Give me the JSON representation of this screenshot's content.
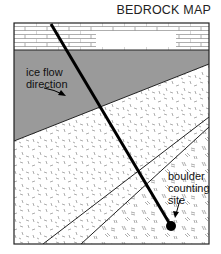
{
  "title": "BEDROCK MAP",
  "labels": {
    "ice_flow_line1": "ice flow",
    "ice_flow_line2": "direction",
    "site_line1": "boulder",
    "site_line2": "counting",
    "site_line3": "site"
  },
  "units": [
    {
      "name": "limestone-brick",
      "pattern": "brick",
      "fill": "#ffffff"
    },
    {
      "name": "gray-band",
      "pattern": "solid",
      "fill": "#9a9a9a"
    },
    {
      "name": "dashed-speckle-unit",
      "pattern": "dashes",
      "fill": "#ffffff"
    },
    {
      "name": "double-dash-unit",
      "pattern": "double-dashes",
      "fill": "#ffffff"
    }
  ],
  "colors": {
    "outline": "#222222",
    "gray_unit": "#9a9a9a",
    "pattern_mark": "#8a8a8a"
  }
}
